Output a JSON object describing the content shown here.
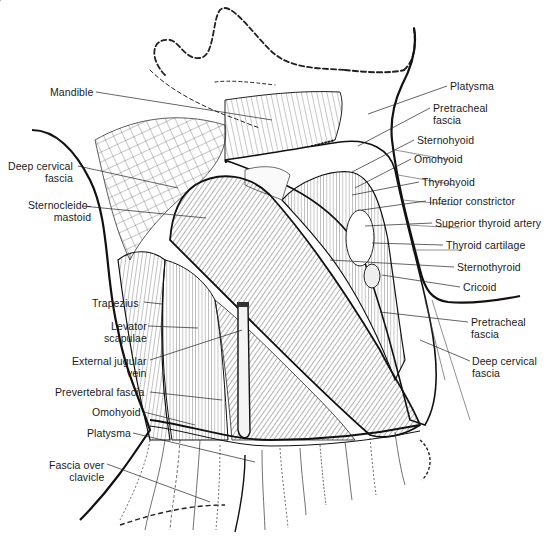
{
  "figure": {
    "type": "anatomical illustration",
    "colors": {
      "ink": "#1a1a1a",
      "background": "#ffffff",
      "leader": "#222222"
    }
  },
  "labels_left": [
    {
      "id": "mandible",
      "text": "Mandible",
      "x": 50,
      "y": 85
    },
    {
      "id": "deep-cervical-fascia-left",
      "lines": [
        "Deep cervical",
        "fascia"
      ],
      "x": 8,
      "y": 160
    },
    {
      "id": "sternocleidomastoid",
      "lines": [
        "Sternocleido-",
        "mastoid"
      ],
      "x": 28,
      "y": 199
    },
    {
      "id": "trapezius",
      "text": "Trapezius",
      "x": 92,
      "y": 297
    },
    {
      "id": "levator-scapulae",
      "lines": [
        "Levator",
        "scapulae"
      ],
      "x": 104,
      "y": 320
    },
    {
      "id": "external-jugular-vein",
      "lines": [
        "External jugular",
        "vein"
      ],
      "x": 72,
      "y": 356
    },
    {
      "id": "prevertebral-fascia",
      "text": "Prevertebral fascia",
      "x": 55,
      "y": 386
    },
    {
      "id": "omohyoid-left",
      "text": "Omohyoid",
      "x": 92,
      "y": 406
    },
    {
      "id": "platysma-left",
      "text": "Platysma",
      "x": 87,
      "y": 427
    },
    {
      "id": "fascia-over-clavicle",
      "lines": [
        "Fascia over",
        "clavicle"
      ],
      "x": 49,
      "y": 459
    }
  ],
  "labels_right": [
    {
      "id": "platysma-right",
      "text": "Platysma",
      "x": 450,
      "y": 80
    },
    {
      "id": "pretracheal-fascia-top",
      "lines": [
        "Pretracheal",
        "fascia"
      ],
      "x": 433,
      "y": 102
    },
    {
      "id": "sternohyoid",
      "text": "Sternohyoid",
      "x": 417,
      "y": 134
    },
    {
      "id": "omohyoid-right",
      "text": "Omohyoid",
      "x": 414,
      "y": 153
    },
    {
      "id": "thyrohyoid",
      "text": "Thyrohyoid",
      "x": 422,
      "y": 176
    },
    {
      "id": "inferior-constrictor",
      "text": "Inferior constrictor",
      "x": 429,
      "y": 195
    },
    {
      "id": "superior-thyroid-artery",
      "text": "Superior thyroid artery",
      "x": 435,
      "y": 217
    },
    {
      "id": "thyroid-cartilage",
      "text": "Thyroid cartilage",
      "x": 446,
      "y": 239
    },
    {
      "id": "sternothyroid",
      "text": "Sternothyroid",
      "x": 457,
      "y": 261
    },
    {
      "id": "cricoid",
      "text": "Cricoid",
      "x": 463,
      "y": 281
    },
    {
      "id": "pretracheal-fascia-bottom",
      "lines": [
        "Pretracheal",
        "fascia"
      ],
      "x": 471,
      "y": 316
    },
    {
      "id": "deep-cervical-fascia-right",
      "lines": [
        "Deep cervical",
        "fascia"
      ],
      "x": 472,
      "y": 355
    }
  ]
}
